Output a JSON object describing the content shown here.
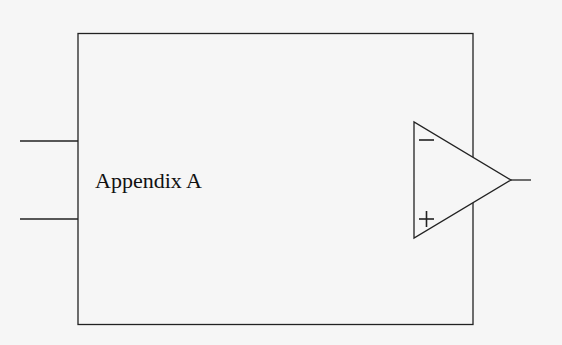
{
  "diagram": {
    "block_label": "Appendix A",
    "opamp": {
      "inverting_symbol": "−",
      "noninverting_symbol": "+"
    },
    "inputs": 2,
    "outputs": 1,
    "colors": {
      "background": "#f6f6f6",
      "stroke": "#222222"
    }
  }
}
